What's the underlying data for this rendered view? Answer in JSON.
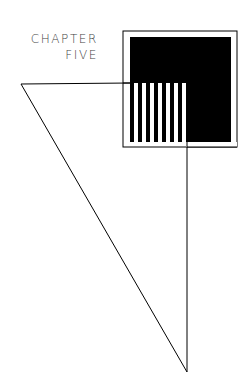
{
  "title": {
    "line1": "CHAPTER",
    "line2": "FIVE"
  },
  "colors": {
    "ink": "#000000",
    "text": "#444444",
    "background": "#ffffff"
  },
  "graphic": {
    "stripe_count": 7
  }
}
